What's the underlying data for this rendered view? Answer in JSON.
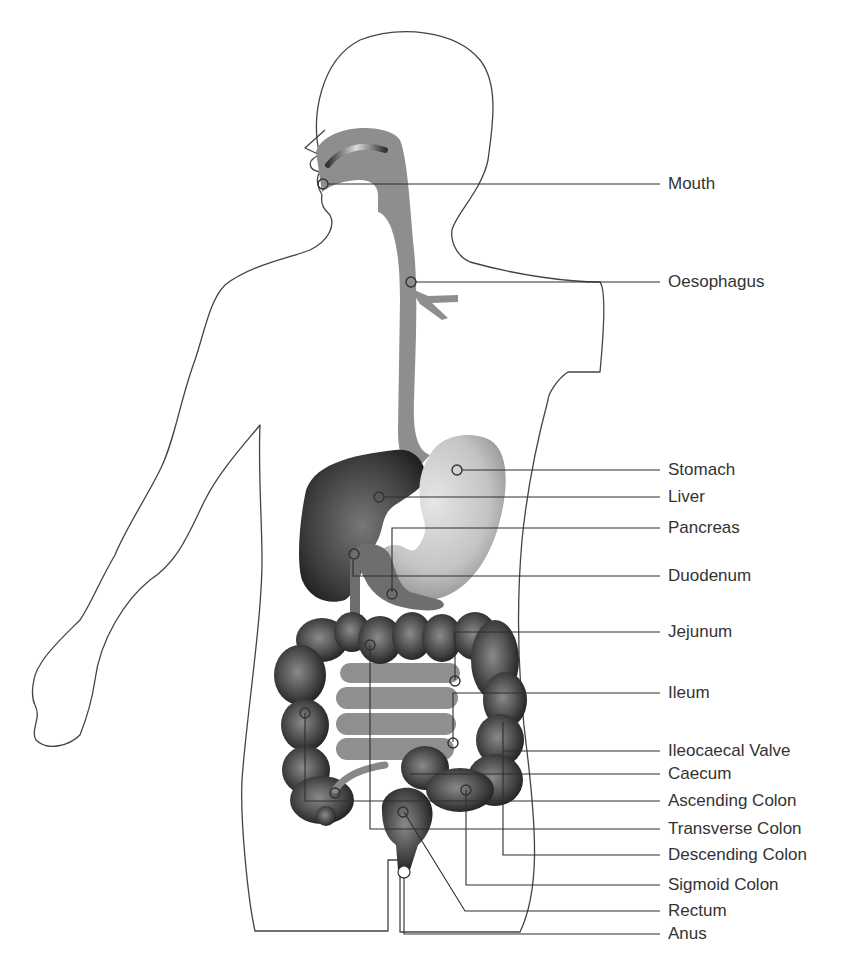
{
  "diagram": {
    "colors": {
      "outline": "#444444",
      "tract_gray": "#8c8c8c",
      "liver": "#3a3a3a",
      "stomach_light": "#d6d6d6",
      "colon_dark": "#333333",
      "label_text": "#333333",
      "background": "#ffffff"
    },
    "labels": [
      {
        "id": "mouth",
        "text": "Mouth",
        "y": 184
      },
      {
        "id": "oesophagus",
        "text": "Oesophagus",
        "y": 282
      },
      {
        "id": "stomach",
        "text": "Stomach",
        "y": 470
      },
      {
        "id": "liver",
        "text": "Liver",
        "y": 497
      },
      {
        "id": "pancreas",
        "text": "Pancreas",
        "y": 528
      },
      {
        "id": "duodenum",
        "text": "Duodenum",
        "y": 576
      },
      {
        "id": "jejunum",
        "text": "Jejunum",
        "y": 632
      },
      {
        "id": "ileum",
        "text": "Ileum",
        "y": 693
      },
      {
        "id": "ileocaecal-valve",
        "text": "Ileocaecal Valve",
        "y": 751
      },
      {
        "id": "caecum",
        "text": "Caecum",
        "y": 774
      },
      {
        "id": "ascending-colon",
        "text": "Ascending Colon",
        "y": 801
      },
      {
        "id": "transverse-colon",
        "text": "Transverse Colon",
        "y": 829
      },
      {
        "id": "descending-colon",
        "text": "Descending Colon",
        "y": 855
      },
      {
        "id": "sigmoid-colon",
        "text": "Sigmoid Colon",
        "y": 885
      },
      {
        "id": "rectum",
        "text": "Rectum",
        "y": 911
      },
      {
        "id": "anus",
        "text": "Anus",
        "y": 934
      }
    ]
  }
}
